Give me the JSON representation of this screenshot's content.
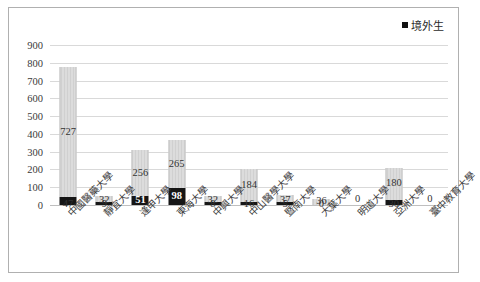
{
  "legend": {
    "swatch_name": "legend-swatch-overseas",
    "label": "境外生"
  },
  "axis": {
    "yticks": [
      "900",
      "800",
      "700",
      "600",
      "500",
      "400",
      "300",
      "200",
      "100",
      "0"
    ]
  },
  "chart_data": {
    "type": "bar",
    "title": "",
    "xlabel": "",
    "ylabel": "",
    "ylim": [
      0,
      900
    ],
    "ytick_step": 100,
    "grid": true,
    "stacked": true,
    "legend_position": "top-right",
    "legend_entries": [
      "境外生"
    ],
    "categories": [
      "中國醫藥大學",
      "靜宜大學",
      "逢甲大學",
      "東海大學",
      "中興大學",
      "中山醫學大學",
      "暨南大學",
      "大葉大學",
      "明道大學",
      "亞洲大學",
      "臺中教育大學"
    ],
    "series": [
      {
        "name": "境外生",
        "color": "#161616",
        "values": [
          47,
          9,
          51,
          98,
          8,
          16,
          5,
          0,
          0,
          30,
          0
        ]
      },
      {
        "name": "本地生",
        "color": "#d4d4d4",
        "values": [
          727,
          32,
          256,
          265,
          32,
          184,
          37,
          36,
          0,
          180,
          0
        ]
      }
    ],
    "totals": [
      774,
      41,
      307,
      363,
      40,
      200,
      42,
      36,
      0,
      210,
      0
    ],
    "zero_labels": [
      "0",
      "0"
    ]
  }
}
